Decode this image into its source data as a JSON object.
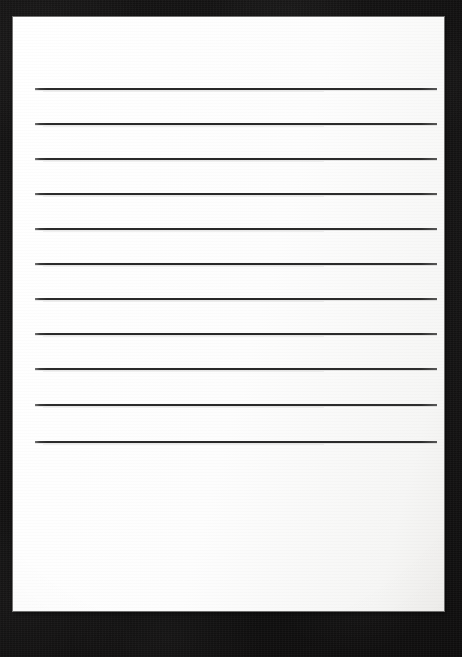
{
  "document": {
    "kind": "scanned-lined-paper",
    "title": "Blank Lined Paper",
    "subject_description": "A blank sheet of ruled writing paper photographed on a dark surface",
    "written_content": "",
    "visible_text": ""
  },
  "canvas": {
    "width": 462,
    "height": 657,
    "background_color": "#121111",
    "background_description": "dark near-black textured surface"
  },
  "paper": {
    "left": 13,
    "top": 17,
    "width": 431,
    "height": 594,
    "color": "#fdfdfd",
    "edge_color": "#bebebc",
    "blank_area_top": 441,
    "blank_area_height": 170
  },
  "rules": {
    "count": 11,
    "color": "#2b2b2b",
    "thickness": 2,
    "left": 22,
    "right": 424,
    "length": 402,
    "first_y": 71,
    "spacing": 35.3,
    "lines": [
      {
        "index": 1,
        "y": 71
      },
      {
        "index": 2,
        "y": 106
      },
      {
        "index": 3,
        "y": 141
      },
      {
        "index": 4,
        "y": 176
      },
      {
        "index": 5,
        "y": 211
      },
      {
        "index": 6,
        "y": 246
      },
      {
        "index": 7,
        "y": 281
      },
      {
        "index": 8,
        "y": 316
      },
      {
        "index": 9,
        "y": 351
      },
      {
        "index": 10,
        "y": 387
      },
      {
        "index": 11,
        "y": 424
      }
    ]
  }
}
